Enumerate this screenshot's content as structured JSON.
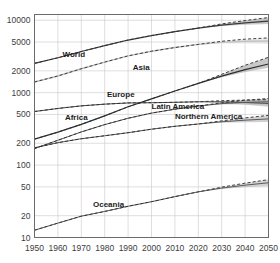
{
  "chart_data": {
    "type": "line",
    "title": "",
    "subtitle": "",
    "xlabel": "",
    "ylabel": "",
    "yscale": "log",
    "ylim": [
      10,
      12000
    ],
    "xlim": [
      1950,
      2050
    ],
    "grid": true,
    "legend": "inline-labels",
    "unit": "millions of people",
    "projection_start": 2020,
    "annotations": [
      "Solid lines are estimates to 2020 and median projections to 2050",
      "Shaded bands and dashed lines show projection uncertainty after 2020"
    ],
    "x": [
      1950,
      1960,
      1970,
      1980,
      1990,
      2000,
      2010,
      2020,
      2030,
      2040,
      2050
    ],
    "yticks": [
      10,
      20,
      50,
      100,
      200,
      500,
      1000,
      2000,
      5000,
      10000
    ],
    "ytick_labels": [
      "10",
      "20",
      "50",
      "100",
      "200",
      "500",
      "1000",
      "2000",
      "5000",
      "10000"
    ],
    "xticks": [
      1950,
      1960,
      1970,
      1980,
      1990,
      2000,
      2010,
      2020,
      2030,
      2040,
      2050
    ],
    "xtick_labels": [
      "1950",
      "1960",
      "1970",
      "1980",
      "1990",
      "2000",
      "2010",
      "2020",
      "2030",
      "2040",
      "2050"
    ],
    "series": [
      {
        "name": "World",
        "label": "World",
        "color": "#3a3a3a",
        "width": 1.2,
        "band_color": "#9a9a9a",
        "label_x": 1962,
        "label_y": 3100,
        "values": [
          2536,
          3034,
          3700,
          4458,
          5327,
          6143,
          6957,
          7795,
          8548,
          9199,
          9735
        ],
        "upper": [
          2536,
          3034,
          3700,
          4458,
          5327,
          6143,
          6957,
          7795,
          8900,
          9900,
          10900
        ],
        "lower": [
          2536,
          3034,
          3700,
          4458,
          5327,
          6143,
          6957,
          7795,
          8300,
          8650,
          8900
        ]
      },
      {
        "name": "Asia",
        "label": "Asia",
        "color": "#c2c2c2",
        "width": 1.4,
        "band_color": "#dadada",
        "label_x": 1992,
        "label_y": 2050,
        "values": [
          1404,
          1700,
          2138,
          2642,
          3221,
          3730,
          4194,
          4641,
          4947,
          5115,
          5160
        ],
        "upper": [
          1404,
          1700,
          2138,
          2642,
          3221,
          3730,
          4194,
          4641,
          5120,
          5480,
          5700
        ],
        "lower": [
          1404,
          1700,
          2138,
          2642,
          3221,
          3730,
          4194,
          4641,
          4790,
          4790,
          4700
        ]
      },
      {
        "name": "Europe",
        "label": "Europe",
        "color": "#4a4a4a",
        "width": 1.0,
        "band_color": "#a5a5a5",
        "label_x": 1981,
        "label_y": 880,
        "values": [
          549,
          605,
          657,
          694,
          721,
          726,
          736,
          748,
          747,
          732,
          710
        ],
        "upper": [
          549,
          605,
          657,
          694,
          721,
          726,
          736,
          748,
          775,
          790,
          800
        ],
        "lower": [
          549,
          605,
          657,
          694,
          721,
          726,
          736,
          748,
          720,
          680,
          640
        ]
      },
      {
        "name": "Africa",
        "label": "Africa",
        "color": "#2f2f2f",
        "width": 1.2,
        "band_color": "#9a9a9a",
        "label_x": 1963,
        "label_y": 420,
        "values": [
          228,
          285,
          365,
          478,
          638,
          819,
          1055,
          1341,
          1689,
          2077,
          2489
        ],
        "upper": [
          228,
          285,
          365,
          478,
          638,
          819,
          1055,
          1341,
          1790,
          2390,
          3080
        ],
        "lower": [
          228,
          285,
          365,
          478,
          638,
          819,
          1055,
          1341,
          1630,
          1930,
          2200
        ]
      },
      {
        "name": "Latin America",
        "label": "Latin America",
        "color": "#5a5a5a",
        "width": 1.0,
        "band_color": "#ababab",
        "label_x": 2000,
        "label_y": 600,
        "values": [
          169,
          220,
          287,
          362,
          443,
          522,
          591,
          654,
          706,
          735,
          749
        ],
        "upper": [
          169,
          220,
          287,
          362,
          443,
          522,
          591,
          654,
          725,
          785,
          830
        ],
        "lower": [
          169,
          220,
          287,
          362,
          443,
          522,
          591,
          654,
          686,
          690,
          680
        ]
      },
      {
        "name": "Northern America",
        "label": "Northern America",
        "color": "#5a5a5a",
        "width": 1.0,
        "band_color": "#ababab",
        "label_x": 2010,
        "label_y": 430,
        "values": [
          173,
          204,
          231,
          254,
          280,
          313,
          343,
          369,
          396,
          417,
          434
        ],
        "upper": [
          173,
          204,
          231,
          254,
          280,
          313,
          343,
          369,
          408,
          448,
          486
        ],
        "lower": [
          173,
          204,
          231,
          254,
          280,
          313,
          343,
          369,
          385,
          390,
          392
        ]
      },
      {
        "name": "Oceania",
        "label": "Oceania",
        "color": "#5a5a5a",
        "width": 1.0,
        "band_color": "#ababab",
        "label_x": 1975,
        "label_y": 26,
        "values": [
          12.6,
          15.8,
          19.7,
          22.9,
          27.0,
          31.2,
          36.7,
          42.7,
          48.1,
          52.8,
          57.0
        ],
        "upper": [
          12.6,
          15.8,
          19.7,
          22.9,
          27.0,
          31.2,
          36.7,
          42.7,
          49.6,
          56.3,
          63.0
        ],
        "lower": [
          12.6,
          15.8,
          19.7,
          22.9,
          27.0,
          31.2,
          36.7,
          42.7,
          46.7,
          49.5,
          51.5
        ]
      }
    ]
  }
}
